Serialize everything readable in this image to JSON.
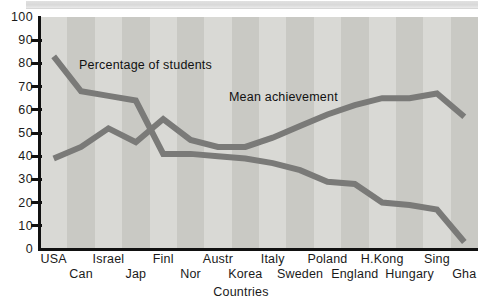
{
  "page": {
    "background_color": "#ffffff",
    "scan_strip_color": "#d8d8d8"
  },
  "chart_data": {
    "type": "line",
    "title": "",
    "subtitle": "",
    "xlabel": "Countries",
    "ylabel": "",
    "ylim": [
      0,
      100
    ],
    "ytick_step": 10,
    "yticks": [
      "100",
      "90",
      "80",
      "70",
      "60",
      "50",
      "40",
      "30",
      "20",
      "10",
      "0"
    ],
    "grid": false,
    "legend_position": "inline-annotations",
    "plot_background": "alternating vertical gray stripes",
    "stripe_colors": [
      "#d9d9d5",
      "#c9c9c4"
    ],
    "line_color": "#7a7a78",
    "line_width": 6,
    "categories": [
      "USA",
      "Can",
      "Israel",
      "Jap",
      "Finl",
      "Nor",
      "Austr",
      "Korea",
      "Italy",
      "Sweden",
      "Poland",
      "England",
      "H.Kong",
      "Hungary",
      "Sing",
      "Gha"
    ],
    "category_label_rows": [
      0,
      1,
      0,
      1,
      0,
      1,
      0,
      1,
      0,
      1,
      0,
      1,
      0,
      1,
      0,
      1
    ],
    "series": [
      {
        "name": "Percentage of students",
        "annotation": "Percentage of students",
        "values": [
          83,
          68,
          66,
          64,
          41,
          41,
          40,
          39,
          37,
          34,
          29,
          28,
          20,
          19,
          17,
          3
        ]
      },
      {
        "name": "Mean achievement",
        "annotation": "Mean achievement",
        "values": [
          39,
          44,
          52,
          46,
          56,
          47,
          44,
          44,
          48,
          53,
          58,
          62,
          65,
          65,
          67,
          57
        ]
      }
    ]
  },
  "annotations": {
    "percentage_label": "Percentage of students",
    "mean_label": "Mean achievement"
  }
}
